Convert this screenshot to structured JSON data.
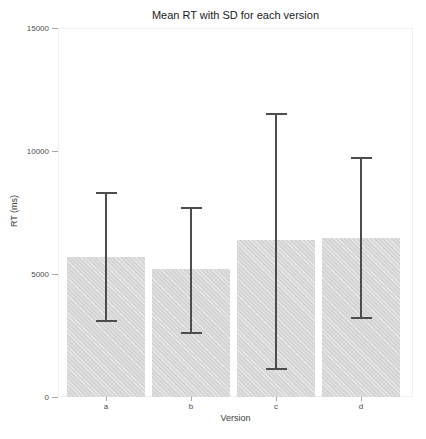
{
  "chart_data": {
    "type": "bar",
    "title": "Mean RT with SD for each version",
    "xlabel": "Version",
    "ylabel": "RT (ms)",
    "categories": [
      "a",
      "b",
      "c",
      "d"
    ],
    "values": [
      5700,
      5200,
      6400,
      6450
    ],
    "error_bars": {
      "upper": [
        8300,
        7700,
        11500,
        9700
      ],
      "lower": [
        3100,
        2600,
        1150,
        3200
      ]
    },
    "ylim": [
      0,
      15000
    ],
    "yticks": [
      0,
      5000,
      10000,
      15000
    ],
    "grid": false,
    "legend_position": "none",
    "bar_color": "#d9d9d9",
    "errorbar_color": "#4d4d4d",
    "tick_color": "#a6a6a6",
    "tick_label_color": "#4d4d4d",
    "axis_title_color": "#404040",
    "title_color": "#1a1a1a",
    "panel_border_color": "#efefef",
    "background_color": "#ffffff"
  }
}
